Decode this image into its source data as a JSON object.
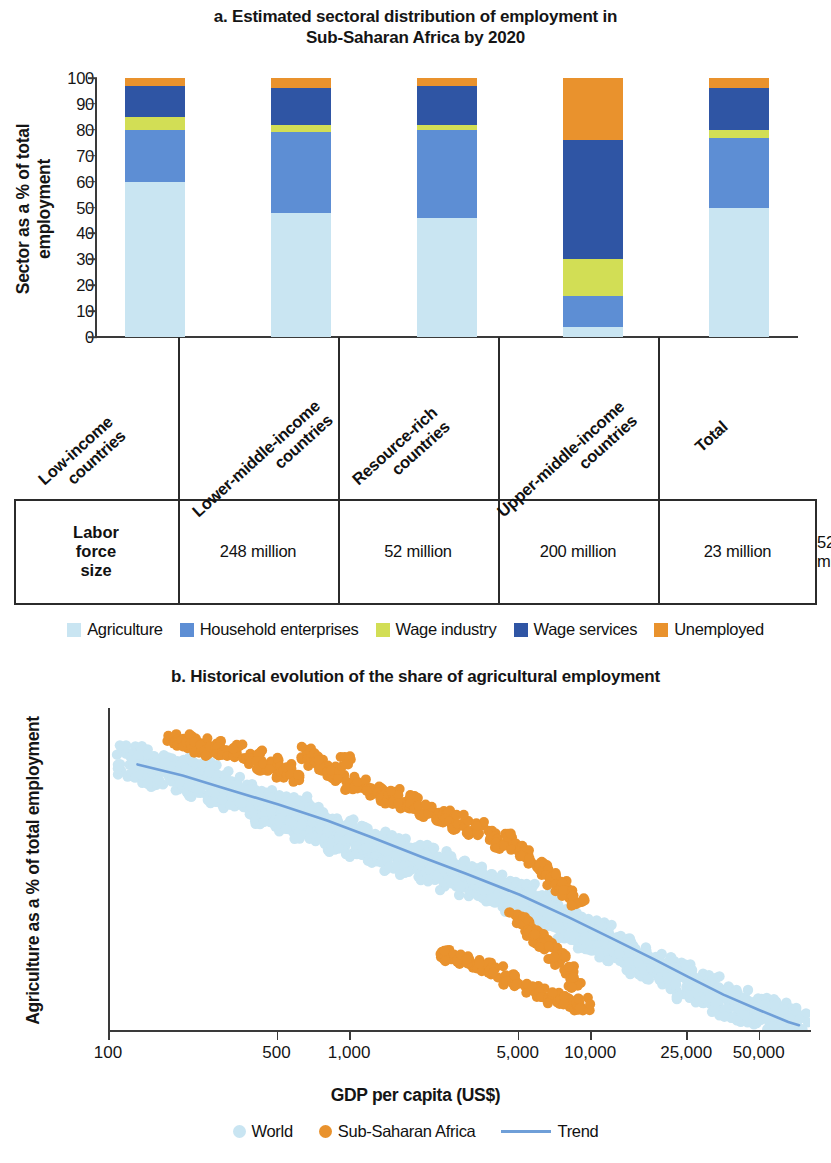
{
  "panel_a": {
    "title": "a. Estimated sectoral distribution of employment in Sub-Saharan Africa by 2020",
    "title_line1": "a. Estimated sectoral distribution of employment in",
    "title_line2": "Sub-Saharan Africa by 2020",
    "ylabel": "Sector as a % of total employment",
    "labor_force_header_l1": "Labor",
    "labor_force_header_l2": "force",
    "labor_force_header_l3": "size",
    "legend": [
      {
        "label": "Agriculture",
        "color": "#c9e5f2"
      },
      {
        "label": "Household enterprises",
        "color": "#5d8ed4"
      },
      {
        "label": "Wage industry",
        "color": "#d2de55"
      },
      {
        "label": "Wage services",
        "color": "#2f55a4"
      },
      {
        "label": "Unemployed",
        "color": "#e9922d"
      }
    ]
  },
  "panel_b": {
    "title": "b. Historical evolution of the share of agricultural employment",
    "ylabel": "Agriculture as a % of total employment",
    "xlabel": "GDP per capita (US$)",
    "legend": [
      {
        "label": "World",
        "color": "#c9e5f2",
        "marker": "dot"
      },
      {
        "label": "Sub-Saharan Africa",
        "color": "#e9922d",
        "marker": "dot"
      },
      {
        "label": "Trend",
        "color": "#6f9fd8",
        "marker": "line"
      }
    ]
  },
  "chart_data": [
    {
      "type": "bar",
      "id": "panel-a-stacked-bar",
      "title": "a. Estimated sectoral distribution of employment in Sub-Saharan Africa by 2020",
      "stacked": true,
      "xlabel": "",
      "ylabel": "Sector as a % of total employment",
      "ylim": [
        0,
        100
      ],
      "yticks": [
        0,
        10,
        20,
        30,
        40,
        50,
        60,
        70,
        80,
        90,
        100
      ],
      "grid": false,
      "legend_position": "bottom",
      "categories": [
        "Low-income countries",
        "Lower-middle-income countries",
        "Resource-rich countries",
        "Upper-middle-income countries",
        "Total"
      ],
      "series": [
        {
          "name": "Agriculture",
          "color": "#c9e5f2",
          "values": [
            60,
            48,
            46,
            4,
            50
          ]
        },
        {
          "name": "Household enterprises",
          "color": "#5d8ed4",
          "values": [
            20,
            31,
            34,
            12,
            27
          ]
        },
        {
          "name": "Wage industry",
          "color": "#d2de55",
          "values": [
            5,
            3,
            2,
            14,
            3
          ]
        },
        {
          "name": "Wage services",
          "color": "#2f55a4",
          "values": [
            12,
            14,
            15,
            46,
            16
          ]
        },
        {
          "name": "Unemployed",
          "color": "#e9922d",
          "values": [
            3,
            4,
            3,
            24,
            4
          ]
        }
      ],
      "table_row_label": "Labor force size",
      "table_values": [
        "248 million",
        "52 million",
        "200 million",
        "23 million",
        "523 million"
      ]
    },
    {
      "type": "scatter",
      "id": "panel-b-scatter",
      "title": "b. Historical evolution of the share of agricultural employment",
      "xlabel": "GDP per capita (US$)",
      "ylabel": "Agriculture as a % of total employment",
      "xscale": "log",
      "xlim": [
        100,
        80000
      ],
      "ylim": [
        0,
        10
      ],
      "yticks": [
        0,
        2,
        4,
        6,
        8,
        10
      ],
      "xticks": [
        100,
        500,
        1000,
        5000,
        10000,
        25000,
        50000
      ],
      "xticklabels": [
        "100",
        "500",
        "1,000",
        "5,000",
        "10,000",
        "25,000",
        "50,000"
      ],
      "grid": false,
      "legend_position": "bottom",
      "series": [
        {
          "name": "World",
          "color": "#c9e5f2",
          "marker": "dot",
          "note": "Dense cloud of country-year points declining from ~8.5 at GDP 120 to ~0.2 at GDP 60,000",
          "points": [
            [
              120,
              8.4
            ],
            [
              130,
              8.2
            ],
            [
              140,
              8.3
            ],
            [
              150,
              8.0
            ],
            [
              160,
              8.1
            ],
            [
              175,
              7.9
            ],
            [
              190,
              8.0
            ],
            [
              210,
              7.8
            ],
            [
              230,
              7.7
            ],
            [
              250,
              7.9
            ],
            [
              270,
              7.5
            ],
            [
              290,
              7.6
            ],
            [
              310,
              7.3
            ],
            [
              330,
              7.4
            ],
            [
              360,
              7.2
            ],
            [
              390,
              7.0
            ],
            [
              420,
              7.1
            ],
            [
              450,
              6.8
            ],
            [
              480,
              6.9
            ],
            [
              520,
              6.7
            ],
            [
              560,
              6.6
            ],
            [
              600,
              6.8
            ],
            [
              650,
              6.4
            ],
            [
              700,
              6.5
            ],
            [
              760,
              6.2
            ],
            [
              820,
              6.3
            ],
            [
              880,
              6.0
            ],
            [
              950,
              6.1
            ],
            [
              1000,
              5.9
            ],
            [
              1100,
              5.8
            ],
            [
              1200,
              5.9
            ],
            [
              1300,
              5.6
            ],
            [
              1400,
              5.7
            ],
            [
              1500,
              5.4
            ],
            [
              1650,
              5.5
            ],
            [
              1800,
              5.2
            ],
            [
              1950,
              5.3
            ],
            [
              2100,
              5.0
            ],
            [
              2300,
              5.1
            ],
            [
              2500,
              4.8
            ],
            [
              2700,
              4.9
            ],
            [
              2900,
              4.6
            ],
            [
              3200,
              4.7
            ],
            [
              3500,
              4.4
            ],
            [
              3800,
              4.5
            ],
            [
              4100,
              4.2
            ],
            [
              4500,
              4.3
            ],
            [
              4900,
              4.0
            ],
            [
              5300,
              4.1
            ],
            [
              5800,
              3.8
            ],
            [
              6300,
              3.9
            ],
            [
              6800,
              3.6
            ],
            [
              7400,
              3.5
            ],
            [
              8000,
              3.3
            ],
            [
              8700,
              3.2
            ],
            [
              9400,
              3.0
            ],
            [
              10000,
              2.9
            ],
            [
              11000,
              2.8
            ],
            [
              12000,
              2.6
            ],
            [
              13000,
              2.5
            ],
            [
              14500,
              2.3
            ],
            [
              16000,
              2.2
            ],
            [
              17500,
              2.0
            ],
            [
              19000,
              1.9
            ],
            [
              21000,
              1.7
            ],
            [
              23000,
              1.6
            ],
            [
              25000,
              1.4
            ],
            [
              27000,
              1.3
            ],
            [
              30000,
              1.2
            ],
            [
              33000,
              1.0
            ],
            [
              36000,
              0.9
            ],
            [
              40000,
              0.8
            ],
            [
              44000,
              0.7
            ],
            [
              48000,
              0.6
            ],
            [
              53000,
              0.5
            ],
            [
              58000,
              0.4
            ],
            [
              63000,
              0.3
            ],
            [
              70000,
              0.2
            ]
          ]
        },
        {
          "name": "Sub-Saharan Africa",
          "color": "#e9922d",
          "marker": "dot",
          "note": "Orange band sits above the world cloud at low GDP; declines from ~9 at GDP 180 to ~0.8 at GDP 9,000",
          "points": [
            [
              180,
              9.0
            ],
            [
              200,
              8.9
            ],
            [
              215,
              9.0
            ],
            [
              230,
              8.8
            ],
            [
              250,
              8.7
            ],
            [
              270,
              8.9
            ],
            [
              290,
              8.6
            ],
            [
              310,
              8.5
            ],
            [
              340,
              8.7
            ],
            [
              370,
              8.4
            ],
            [
              400,
              8.5
            ],
            [
              430,
              8.2
            ],
            [
              470,
              8.3
            ],
            [
              510,
              8.0
            ],
            [
              550,
              8.1
            ],
            [
              600,
              7.8
            ],
            [
              650,
              8.6
            ],
            [
              700,
              8.4
            ],
            [
              760,
              8.2
            ],
            [
              820,
              8.0
            ],
            [
              880,
              7.9
            ],
            [
              950,
              8.3
            ],
            [
              1000,
              7.6
            ],
            [
              1100,
              7.7
            ],
            [
              1200,
              7.4
            ],
            [
              1300,
              7.5
            ],
            [
              1400,
              7.2
            ],
            [
              1500,
              7.3
            ],
            [
              1650,
              7.0
            ],
            [
              1800,
              7.1
            ],
            [
              1950,
              6.8
            ],
            [
              2100,
              6.9
            ],
            [
              2300,
              6.6
            ],
            [
              2500,
              6.7
            ],
            [
              2700,
              6.4
            ],
            [
              2900,
              6.5
            ],
            [
              3200,
              6.2
            ],
            [
              3500,
              6.3
            ],
            [
              3800,
              6.0
            ],
            [
              4100,
              5.8
            ],
            [
              4500,
              5.9
            ],
            [
              4900,
              5.6
            ],
            [
              5300,
              5.4
            ],
            [
              5800,
              5.2
            ],
            [
              6300,
              5.0
            ],
            [
              6800,
              4.7
            ],
            [
              7400,
              4.5
            ],
            [
              8000,
              4.2
            ],
            [
              8700,
              4.0
            ],
            [
              2400,
              2.4
            ],
            [
              2600,
              2.3
            ],
            [
              2900,
              2.2
            ],
            [
              3200,
              2.1
            ],
            [
              3600,
              1.9
            ],
            [
              4000,
              1.8
            ],
            [
              4500,
              1.6
            ],
            [
              5000,
              1.5
            ],
            [
              5600,
              1.3
            ],
            [
              6200,
              1.2
            ],
            [
              7000,
              1.0
            ],
            [
              7800,
              0.9
            ],
            [
              8600,
              0.8
            ],
            [
              9200,
              0.8
            ],
            [
              4800,
              3.5
            ],
            [
              5200,
              3.3
            ],
            [
              5600,
              3.0
            ],
            [
              6000,
              2.8
            ],
            [
              6400,
              2.6
            ],
            [
              6900,
              2.4
            ],
            [
              7400,
              2.2
            ],
            [
              7900,
              1.8
            ],
            [
              8400,
              1.5
            ]
          ]
        },
        {
          "name": "Trend",
          "color": "#6f9fd8",
          "marker": "line",
          "note": "Smooth fitted curve",
          "points": [
            [
              130,
              8.25
            ],
            [
              200,
              7.9
            ],
            [
              300,
              7.5
            ],
            [
              500,
              7.0
            ],
            [
              800,
              6.5
            ],
            [
              1200,
              6.0
            ],
            [
              2000,
              5.35
            ],
            [
              3000,
              4.85
            ],
            [
              5000,
              4.2
            ],
            [
              8000,
              3.5
            ],
            [
              12000,
              2.85
            ],
            [
              18000,
              2.2
            ],
            [
              25000,
              1.65
            ],
            [
              35000,
              1.1
            ],
            [
              50000,
              0.6
            ],
            [
              65000,
              0.25
            ],
            [
              72000,
              0.15
            ]
          ]
        }
      ]
    }
  ]
}
